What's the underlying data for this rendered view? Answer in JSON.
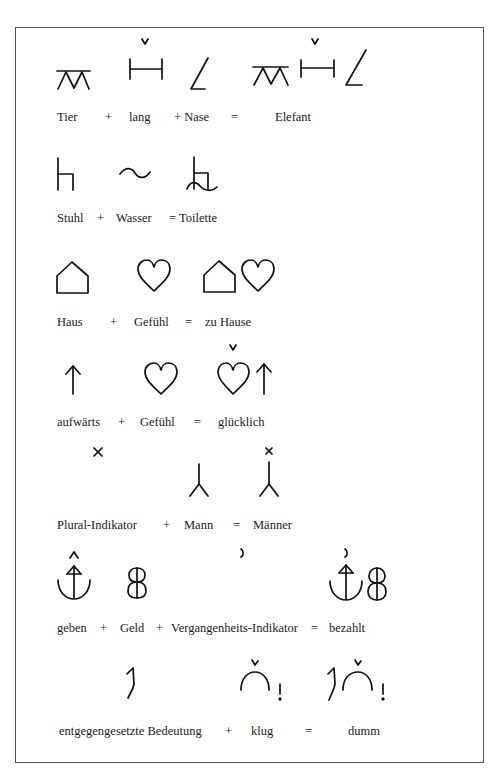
{
  "page": {
    "type": "Blissymbolics examples (German)",
    "rows": [
      {
        "id": "elefant",
        "glyphs": [
          "animal-symbol",
          "long-symbol",
          "nose-symbol",
          "elephant-symbol"
        ],
        "terms": [
          {
            "text": "Tier"
          },
          {
            "text": "+"
          },
          {
            "text": "lang"
          },
          {
            "text": "+ Nase"
          },
          {
            "text": "="
          },
          {
            "text": "Elefant"
          }
        ]
      },
      {
        "id": "toilette",
        "glyphs": [
          "chair-symbol",
          "water-symbol",
          "toilet-symbol"
        ],
        "terms": [
          {
            "text": "Stuhl"
          },
          {
            "text": "+"
          },
          {
            "text": "Wasser"
          },
          {
            "text": "= Toilette"
          }
        ]
      },
      {
        "id": "zu-hause",
        "glyphs": [
          "house-symbol",
          "feeling-heart-symbol",
          "at-home-symbol"
        ],
        "terms": [
          {
            "text": "Haus"
          },
          {
            "text": "+"
          },
          {
            "text": "Gefühl"
          },
          {
            "text": "="
          },
          {
            "text": "zu Hause"
          }
        ]
      },
      {
        "id": "gluecklich",
        "glyphs": [
          "upward-arrow-symbol",
          "feeling-heart-symbol",
          "happy-symbol"
        ],
        "terms": [
          {
            "text": "aufwärts"
          },
          {
            "text": "+"
          },
          {
            "text": "Gefühl"
          },
          {
            "text": "="
          },
          {
            "text": "glücklich"
          }
        ]
      },
      {
        "id": "maenner",
        "glyphs": [
          "plural-indicator-symbol",
          "man-symbol",
          "men-symbol"
        ],
        "terms": [
          {
            "text": "Plural-Indikator"
          },
          {
            "text": "+"
          },
          {
            "text": "Mann"
          },
          {
            "text": "="
          },
          {
            "text": "Männer"
          }
        ]
      },
      {
        "id": "bezahlt",
        "glyphs": [
          "give-symbol",
          "money-symbol",
          "past-tense-indicator-symbol",
          "paid-symbol"
        ],
        "terms": [
          {
            "text": "geben"
          },
          {
            "text": "+"
          },
          {
            "text": "Geld"
          },
          {
            "text": "+"
          },
          {
            "text": "Vergangenheits-Indikator"
          },
          {
            "text": "="
          },
          {
            "text": "bezahlt"
          }
        ]
      },
      {
        "id": "dumm",
        "glyphs": [
          "opposite-meaning-symbol",
          "clever-symbol",
          "stupid-symbol"
        ],
        "terms": [
          {
            "text": "entgegengesetzte Bedeutung"
          },
          {
            "text": "+"
          },
          {
            "text": "klug"
          },
          {
            "text": "="
          },
          {
            "text": "dumm"
          }
        ]
      }
    ]
  }
}
